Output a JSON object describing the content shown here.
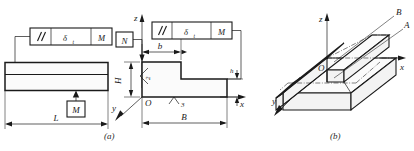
{
  "drawing": {
    "title": "Parallelism tolerance of a stepped block",
    "captions": {
      "a": "(a)",
      "b": "(b)"
    }
  },
  "figure_a": {
    "name": "front-view",
    "feature_control_frame": {
      "symbol": "//",
      "symbol_name": "parallelism-symbol",
      "tolerance_value": "δ",
      "tolerance_subscript": "t",
      "datum": "M"
    },
    "datum_feature": {
      "label": "M"
    },
    "dimensions": [
      {
        "name": "length",
        "label": "L"
      }
    ]
  },
  "figure_mid": {
    "name": "side-section-view",
    "feature_control_frame": {
      "symbol": "//",
      "symbol_name": "parallelism-symbol",
      "tolerance_value": "δ",
      "tolerance_subscript": "t",
      "datum": "M"
    },
    "note_box": {
      "label": "N"
    },
    "axes": {
      "x": "x",
      "y": "y",
      "z": "z",
      "origin": "O"
    },
    "dimensions": [
      {
        "name": "step-width",
        "label": "b"
      },
      {
        "name": "overall-width",
        "label": "B"
      },
      {
        "name": "step-height",
        "label": "h"
      },
      {
        "name": "overall-height",
        "label": "H"
      }
    ],
    "surface_callouts": [
      {
        "name": "surface-2",
        "label": "2"
      },
      {
        "name": "surface-3",
        "label": "3"
      }
    ]
  },
  "figure_b": {
    "name": "isometric-view",
    "axes": {
      "x": "x",
      "y": "y",
      "z": "z",
      "origin": "O"
    },
    "plane_labels": [
      {
        "name": "plane-b",
        "label": "B"
      },
      {
        "name": "plane-a",
        "label": "A"
      }
    ]
  },
  "colors": {
    "line": "#1a1a1a",
    "background": "#ffffff",
    "face_light": "#fbfbfb",
    "face_shade": "#f3f3f3"
  }
}
